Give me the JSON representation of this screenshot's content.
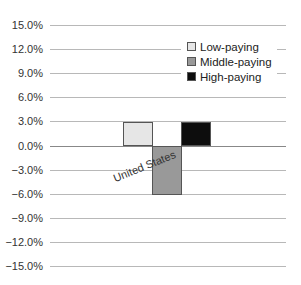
{
  "chart_data": {
    "type": "bar",
    "title": "",
    "xlabel": "",
    "ylabel": "",
    "categories": [
      "United States"
    ],
    "series": [
      {
        "name": "Low-paying",
        "values": [
          2.9
        ],
        "color": "#e6e6e6"
      },
      {
        "name": "Middle-paying",
        "values": [
          -6.0
        ],
        "color": "#999999"
      },
      {
        "name": "High-paying",
        "values": [
          2.9
        ],
        "color": "#0d0d0d"
      }
    ],
    "ylim": [
      -15.0,
      15.0
    ],
    "yticks": [
      15.0,
      12.0,
      9.0,
      6.0,
      3.0,
      0.0,
      -3.0,
      -6.0,
      -9.0,
      -12.0,
      -15.0
    ],
    "ytick_labels": [
      "15.0%",
      "12.0%",
      "9.0%",
      "6.0%",
      "3.0%",
      "0.0%",
      "−3.0%",
      "−6.0%",
      "−9.0%",
      "−12.0%",
      "−15.0%"
    ],
    "grid": true,
    "legend_position": "upper right",
    "category_label_rotation": -22
  },
  "legend": {
    "items": [
      {
        "label": "Low-paying"
      },
      {
        "label": "Middle-paying"
      },
      {
        "label": "High-paying"
      }
    ]
  },
  "axis": {
    "category_label": "United States"
  }
}
